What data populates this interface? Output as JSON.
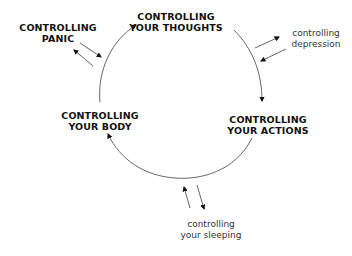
{
  "diagram": {
    "nodes": {
      "thoughts": {
        "line1": "CONTROLLING",
        "line2": "YOUR THOUGHTS"
      },
      "actions": {
        "line1": "CONTROLLING",
        "line2": "YOUR ACTIONS"
      },
      "body": {
        "line1": "CONTROLLING",
        "line2": "YOUR BODY"
      },
      "panic": {
        "line1": "CONTROLLING",
        "line2": "PANIC"
      }
    },
    "satellites": {
      "depression": {
        "line1": "controlling",
        "line2": "depression"
      },
      "sleeping": {
        "line1": "controlling",
        "line2": "your sleeping"
      }
    },
    "colors": {
      "text": "#111111",
      "arrow": "#555555",
      "background": "#ffffff"
    }
  }
}
